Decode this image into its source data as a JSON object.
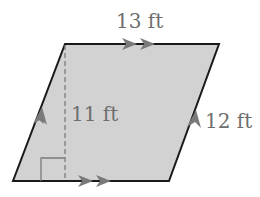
{
  "figure": {
    "shape": "parallelogram",
    "fill_color": "#d2d2d2",
    "edge_color": "#1a1a1a",
    "mark_color": "#7a7a7a",
    "labels": {
      "top_base": "13 ft",
      "height": "11 ft",
      "side": "12 ft"
    },
    "markings": {
      "parallel_double_arrows": [
        "top",
        "bottom"
      ],
      "parallel_single_arrows": [
        "left",
        "right"
      ],
      "right_angle": "bottom-left of height line",
      "height_line_style": "dashed"
    }
  }
}
